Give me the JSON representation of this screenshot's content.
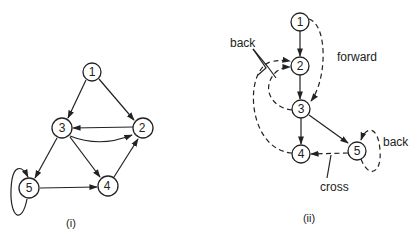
{
  "figure_i": {
    "caption": "(i)",
    "nodes": [
      {
        "id": "1",
        "label": "1"
      },
      {
        "id": "2",
        "label": "2"
      },
      {
        "id": "3",
        "label": "3"
      },
      {
        "id": "4",
        "label": "4"
      },
      {
        "id": "5",
        "label": "5"
      }
    ],
    "edges": [
      {
        "from": "1",
        "to": "3"
      },
      {
        "from": "1",
        "to": "2"
      },
      {
        "from": "2",
        "to": "3"
      },
      {
        "from": "3",
        "to": "2"
      },
      {
        "from": "3",
        "to": "5"
      },
      {
        "from": "3",
        "to": "4"
      },
      {
        "from": "4",
        "to": "2"
      },
      {
        "from": "5",
        "to": "4"
      },
      {
        "from": "5",
        "to": "5"
      }
    ]
  },
  "figure_ii": {
    "caption": "(ii)",
    "nodes": [
      {
        "id": "1",
        "label": "1"
      },
      {
        "id": "2",
        "label": "2"
      },
      {
        "id": "3",
        "label": "3"
      },
      {
        "id": "4",
        "label": "4"
      },
      {
        "id": "5",
        "label": "5"
      }
    ],
    "tree_edges": [
      {
        "from": "1",
        "to": "2"
      },
      {
        "from": "2",
        "to": "3"
      },
      {
        "from": "3",
        "to": "4"
      },
      {
        "from": "3",
        "to": "5"
      }
    ],
    "nontree_edges": [
      {
        "from": "1",
        "to": "3",
        "type": "forward"
      },
      {
        "from": "3",
        "to": "2",
        "type": "back"
      },
      {
        "from": "4",
        "to": "2",
        "type": "back"
      },
      {
        "from": "5",
        "to": "5",
        "type": "back"
      },
      {
        "from": "5",
        "to": "4",
        "type": "cross"
      }
    ],
    "labels": {
      "back_left": "back",
      "forward": "forward",
      "back_right": "back",
      "cross": "cross"
    }
  }
}
